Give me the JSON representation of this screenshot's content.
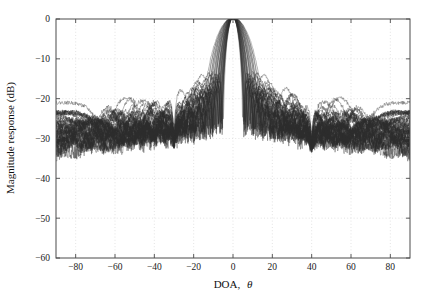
{
  "chart_data": {
    "type": "line",
    "title": "",
    "xlabel": "DOA, θ",
    "ylabel": "Magnitude response (dB)",
    "xlim": [
      -90,
      90
    ],
    "ylim": [
      -60,
      0
    ],
    "xticks": [
      -80,
      -60,
      -40,
      -20,
      0,
      20,
      40,
      60,
      80
    ],
    "xticklabels": [
      "−80",
      "−60",
      "−40",
      "−20",
      "0",
      "20",
      "40",
      "60",
      "80"
    ],
    "yticks": [
      0,
      -10,
      -20,
      -30,
      -40,
      -50,
      -60
    ],
    "yticklabels": [
      "0",
      "−10",
      "−20",
      "−30",
      "−40",
      "−50",
      "−60"
    ],
    "grid": true,
    "legend": null,
    "series_count": 40,
    "series_color": "#2b2b2b",
    "mainlobe_peak_deg": 0,
    "mainlobe_peak_db": 0,
    "nulls_deg": [
      -30,
      40
    ],
    "null_depth_db": [
      -41,
      -41
    ],
    "sidelobe_envelope_db": -16,
    "edge_level_db": -18,
    "mainlobe_halfwidth_range_deg": [
      8,
      17
    ],
    "secondary_lobe_peaks_deg": [
      -44,
      -19,
      19,
      27,
      60
    ],
    "secondary_lobe_peaks_db": [
      -14.5,
      -13,
      -13.5,
      -13.5,
      -14.5
    ]
  },
  "axes": {
    "x_label": "DOA, θ",
    "x_label_main": "DOA,",
    "x_label_symbol": "θ",
    "y_label": "Magnitude response (dB)"
  }
}
